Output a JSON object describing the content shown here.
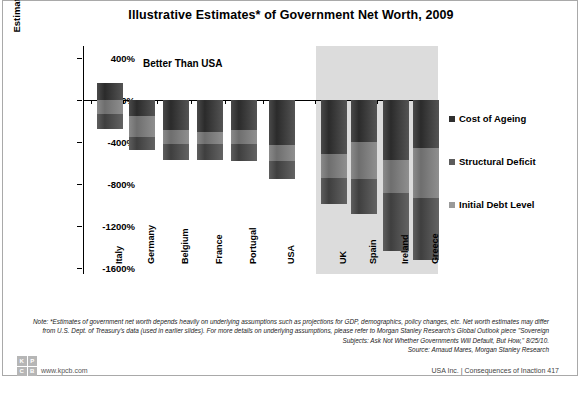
{
  "title": "Illustrative Estimates* of Government Net Worth, 2009",
  "groups": {
    "better": "Better Than USA",
    "worse": "Worse Than USA"
  },
  "legend": [
    {
      "key": "ageing",
      "label": "Cost of Ageing"
    },
    {
      "key": "struct",
      "label": "Structural Deficit"
    },
    {
      "key": "debt",
      "label": "Initial Debt Level"
    }
  ],
  "note": {
    "lead": "Note:",
    "body": "*Estimates of government net worth depends heavily on underlying assumptions such as projections for GDP, demographics, policy changes, etc. Net worth estimates may differ from U.S. Dept. of Treasury's data (used in earlier slides). For more details on underlying assumptions, please refer to Morgan Stanley Research's Global Outlook piece \"Sovereign Subjects: Ask Not Whether Governments Will Default, But How,\" 8/25/10."
  },
  "source": "Source: Arnaud Mares, Morgan Stanley Research",
  "footer": {
    "logo": [
      "K",
      "P",
      "C",
      "B"
    ],
    "url": "www.kpcb.com",
    "page": "USA Inc. | Consequences of Inaction   417",
    "band": "USA Inc."
  },
  "chart_data": {
    "type": "bar",
    "title": "Illustrative Estimates* of Government Net Worth, 2009",
    "xlabel": "",
    "ylabel": "Estimated Government Net Worth as % of GDP",
    "ylim": [
      -1600,
      400
    ],
    "yticks": [
      "400%",
      "0%",
      "-400%",
      "-800%",
      "-1200%",
      "-1600%"
    ],
    "ytick_values": [
      400,
      0,
      -400,
      -800,
      -1200,
      -1600
    ],
    "grid": false,
    "stacked": true,
    "legend_position": "right",
    "categories": [
      "Italy",
      "Germany",
      "Belgium",
      "France",
      "Portugal",
      "USA",
      "UK",
      "Spain",
      "Ireland",
      "Greece"
    ],
    "group_split_index": 6,
    "series": [
      {
        "name": "Cost of Ageing",
        "values": [
          160,
          -150,
          -290,
          -300,
          -290,
          -430,
          -510,
          -400,
          -570,
          -460
        ]
      },
      {
        "name": "Structural Deficit",
        "values": [
          -130,
          -200,
          -130,
          -120,
          -130,
          -150,
          -230,
          -350,
          -320,
          -470
        ]
      },
      {
        "name": "Initial Debt Level",
        "values": [
          -150,
          -130,
          -150,
          -150,
          -160,
          -170,
          -250,
          -340,
          -550,
          -590
        ]
      }
    ],
    "totals": [
      -280,
      -480,
      -570,
      -570,
      -580,
      -750,
      -990,
      -1090,
      -1440,
      -1520
    ]
  }
}
